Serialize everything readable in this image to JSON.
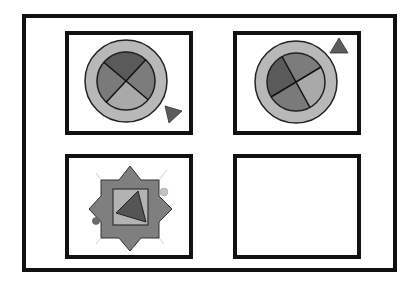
{
  "figure": {
    "colors": {
      "background": "#ffffff",
      "border": "#111111",
      "ring": "#b8b8b8",
      "quadrant_dark": "#5a5a5a",
      "quadrant_mid": "#7c7c7c",
      "quadrant_light": "#a9a9a9",
      "triangle": "#5c5c5c",
      "star": "#7f7f7f",
      "inner_square": "#b3b3b3",
      "dot_light": "#c2c2c2",
      "dot_dark": "#6a6a6a",
      "ray": "#cfcfcf"
    },
    "cells": [
      {
        "position": "top-left",
        "content": "circle with ring, 4 quadrants (top dark), triangle at lower-right"
      },
      {
        "position": "top-right",
        "content": "circle with ring, 4 quadrants (left dark), triangle at upper-right"
      },
      {
        "position": "bottom-left",
        "content": "8-point star with inner square, triangle inside, two dots"
      },
      {
        "position": "bottom-right",
        "content": "empty"
      }
    ]
  }
}
